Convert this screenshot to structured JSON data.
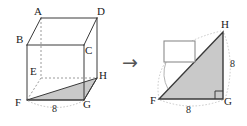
{
  "figure": {
    "colors": {
      "stroke": "#3a3a3a",
      "hidden_stroke": "#8a8a8a",
      "shade_fill": "#c9c9c9",
      "arc": "#bbbbbb",
      "arrow": "#555555",
      "background": "#ffffff",
      "box_fill": "#ffffff"
    }
  },
  "left_solid": {
    "name": "cube",
    "vertices": [
      {
        "id": "A",
        "label": "A",
        "x": 41,
        "y": 18
      },
      {
        "id": "D",
        "label": "D",
        "x": 97,
        "y": 18
      },
      {
        "id": "B",
        "label": "B",
        "x": 27,
        "y": 45
      },
      {
        "id": "C",
        "label": "C",
        "x": 84,
        "y": 45
      },
      {
        "id": "E",
        "label": "E",
        "x": 41,
        "y": 78
      },
      {
        "id": "H",
        "label": "H",
        "x": 97,
        "y": 78
      },
      {
        "id": "F",
        "label": "F",
        "x": 27,
        "y": 100
      },
      {
        "id": "G",
        "label": "G",
        "x": 84,
        "y": 100
      }
    ],
    "shaded_face": [
      "F",
      "G",
      "H"
    ],
    "hidden_vertex": "E",
    "edge_label": {
      "text": "8",
      "x": 52,
      "y": 106
    }
  },
  "arrow": {
    "glyph": "→",
    "x": 122,
    "y": 57
  },
  "right_figure": {
    "name": "right-triangle",
    "vertices": [
      {
        "id": "F",
        "label": "F",
        "x": 159,
        "y": 99
      },
      {
        "id": "G",
        "label": "G",
        "x": 223,
        "y": 99
      },
      {
        "id": "H",
        "label": "H",
        "x": 223,
        "y": 32
      }
    ],
    "right_angle_at": "G",
    "labels": {
      "base": {
        "text": "8",
        "x": 189,
        "y": 108
      },
      "height": {
        "text": "8",
        "x": 229,
        "y": 64
      }
    },
    "answer_box": {
      "value": "",
      "x": 164,
      "y": 41,
      "width": 31,
      "height": 21
    }
  }
}
